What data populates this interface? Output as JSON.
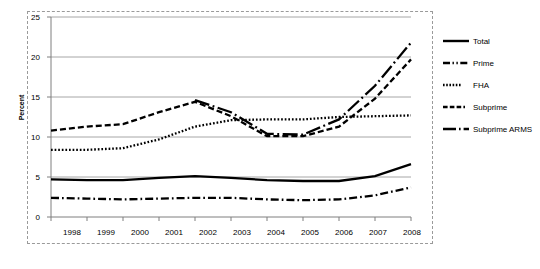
{
  "chart_data": {
    "type": "line",
    "title": "",
    "xlabel": "",
    "ylabel": "Percent",
    "x": [
      1998,
      1999,
      2000,
      2001,
      2002,
      2003,
      2004,
      2005,
      2006,
      2007,
      2008
    ],
    "categories": [
      "1998",
      "1999",
      "2000",
      "2001",
      "2002",
      "2003",
      "2004",
      "2005",
      "2006",
      "2007",
      "2008"
    ],
    "xlim": [
      1998,
      2008
    ],
    "ylim": [
      0,
      25
    ],
    "yticks": [
      0,
      5,
      10,
      15,
      20,
      25
    ],
    "grid": "horizontal",
    "legend_position": "right",
    "series": [
      {
        "name": "Total",
        "style": "solid",
        "color": "#000000",
        "values": [
          4.7,
          4.6,
          4.6,
          4.9,
          5.1,
          4.9,
          4.6,
          4.5,
          4.5,
          5.1,
          6.6
        ]
      },
      {
        "name": "Prime",
        "style": "dash-dot",
        "color": "#000000",
        "values": [
          2.4,
          2.3,
          2.2,
          2.3,
          2.4,
          2.4,
          2.2,
          2.1,
          2.2,
          2.7,
          3.7
        ]
      },
      {
        "name": "FHA",
        "style": "dotted",
        "color": "#000000",
        "values": [
          8.4,
          8.4,
          8.6,
          9.7,
          11.3,
          12.1,
          12.2,
          12.2,
          12.5,
          12.6,
          12.7
        ]
      },
      {
        "name": "Subprime",
        "style": "dashed",
        "color": "#000000",
        "values": [
          10.8,
          11.3,
          11.6,
          13.1,
          14.4,
          12.6,
          10.1,
          10.1,
          11.3,
          14.8,
          19.7
        ]
      },
      {
        "name": "Subprime ARMS",
        "style": "long-dash-dot",
        "color": "#000000",
        "values": [
          null,
          null,
          null,
          null,
          14.6,
          13.1,
          10.4,
          10.3,
          12.2,
          16.4,
          21.8
        ]
      }
    ]
  },
  "legend": {
    "items": [
      {
        "label": "Total"
      },
      {
        "label": "Prime"
      },
      {
        "label": "FHA"
      },
      {
        "label": "Subprime"
      },
      {
        "label": "Subprime ARMS"
      }
    ]
  },
  "axes": {
    "y_title": "Percent",
    "y_labels": [
      "25",
      "20",
      "15",
      "10",
      "5",
      "0"
    ],
    "x_labels": [
      "1998",
      "1999",
      "2000",
      "2001",
      "2002",
      "2003",
      "2004",
      "2005",
      "2006",
      "2007",
      "2008"
    ]
  }
}
